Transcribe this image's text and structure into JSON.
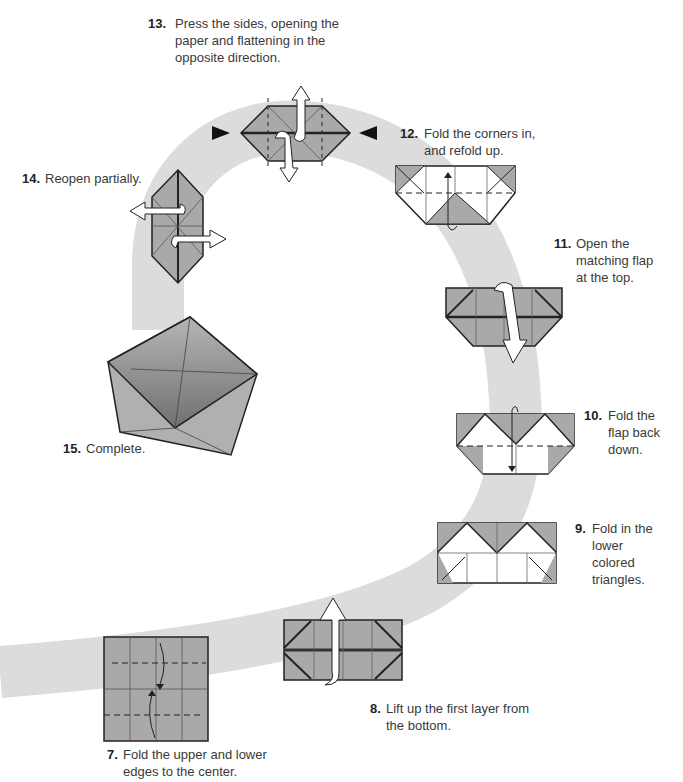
{
  "colors": {
    "path_band": "#d9d9d9",
    "paper_colored": "#a9a9a9",
    "paper_white": "#ffffff",
    "line": "#222222",
    "arrow_fill": "#ffffff"
  },
  "steps": [
    {
      "num": "7.",
      "text": "Fold the upper and lower edges to the center."
    },
    {
      "num": "8.",
      "text": "Lift up the first layer from the bottom."
    },
    {
      "num": "9.",
      "text": "Fold in the lower colored triangles."
    },
    {
      "num": "10.",
      "text": "Fold the flap back down."
    },
    {
      "num": "11.",
      "text": "Open the matching flap at the top."
    },
    {
      "num": "12.",
      "text": "Fold the corners in, and refold up."
    },
    {
      "num": "13.",
      "text": "Press the sides, opening the paper and flattening in the opposite direction."
    },
    {
      "num": "14.",
      "text": "Reopen partially."
    },
    {
      "num": "15.",
      "text": "Complete."
    }
  ]
}
